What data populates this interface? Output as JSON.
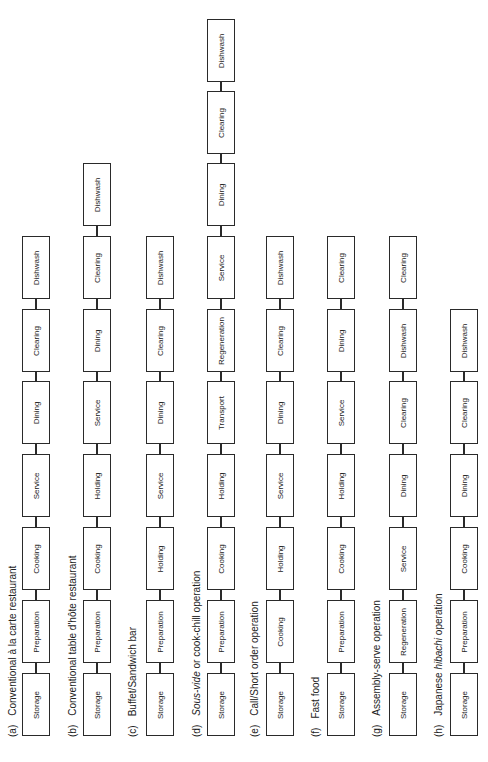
{
  "diagram": {
    "orientation": "rotated-90-ccw",
    "rows": [
      {
        "letter": "(a)",
        "title_parts": [
          {
            "t": "Conventional à la carte restaurant",
            "i": false
          }
        ],
        "steps": [
          "Storage",
          "Preparation",
          "Cooking",
          "Service",
          "Dining",
          "Clearing",
          "Dishwash"
        ]
      },
      {
        "letter": "(b)",
        "title_parts": [
          {
            "t": "Conventional table d'hôte restaurant",
            "i": false
          }
        ],
        "steps": [
          "Storage",
          "Preparation",
          "Cooking",
          "Holding",
          "Service",
          "Dining",
          "Clearing",
          "Dishwash"
        ]
      },
      {
        "letter": "(c)",
        "title_parts": [
          {
            "t": "Buffet/Sandwich bar",
            "i": false
          }
        ],
        "steps": [
          "Storage",
          "Preparation",
          "Holding",
          "Service",
          "Dining",
          "Clearing",
          "Dishwash"
        ]
      },
      {
        "letter": "(d)",
        "title_parts": [
          {
            "t": "Sous-vide",
            "i": true
          },
          {
            "t": " or cook-chill operation",
            "i": false
          }
        ],
        "steps": [
          "Storage",
          "Preparation",
          "Cooking",
          "Holding",
          "Transport",
          "Regeneration",
          "Service",
          "Dining",
          "Clearing",
          "Dishwash"
        ]
      },
      {
        "letter": "(e)",
        "title_parts": [
          {
            "t": "Call/Short order operation",
            "i": false
          }
        ],
        "steps": [
          "Storage",
          "Cooking",
          "Holding",
          "Service",
          "Dining",
          "Clearing",
          "Dishwash"
        ]
      },
      {
        "letter": "(f)",
        "title_parts": [
          {
            "t": "Fast food",
            "i": false
          }
        ],
        "steps": [
          "Storage",
          "Preparation",
          "Cooking",
          "Holding",
          "Service",
          "Dining",
          "Clearing"
        ]
      },
      {
        "letter": "(g)",
        "title_parts": [
          {
            "t": "Assembly-serve operation",
            "i": false
          }
        ],
        "steps": [
          "Storage",
          "Regeneration",
          "Service",
          "Dining",
          "Clearing",
          "Dishwash",
          "Clearing"
        ]
      },
      {
        "letter": "(h)",
        "title_parts": [
          {
            "t": "Japanese ",
            "i": false
          },
          {
            "t": "hibachi",
            "i": true
          },
          {
            "t": " operation",
            "i": false
          }
        ],
        "steps": [
          "Storage",
          "Preparation",
          "Cooking",
          "Dining",
          "Clearing",
          "Dishwash"
        ]
      }
    ]
  },
  "layout": {
    "row_box_left": [
      22,
      83,
      146,
      207,
      266,
      327,
      389,
      450
    ],
    "row_label_x": [
      7,
      67,
      127,
      191,
      249,
      310,
      371,
      433
    ],
    "slot_tops": [
      673,
      600,
      527,
      454,
      381,
      309,
      236,
      163,
      91,
      19
    ],
    "label_bottom_y": 737,
    "box_height": 63,
    "colors": {
      "line": "#2a2a2a",
      "text": "#222222",
      "background": "#ffffff"
    }
  }
}
